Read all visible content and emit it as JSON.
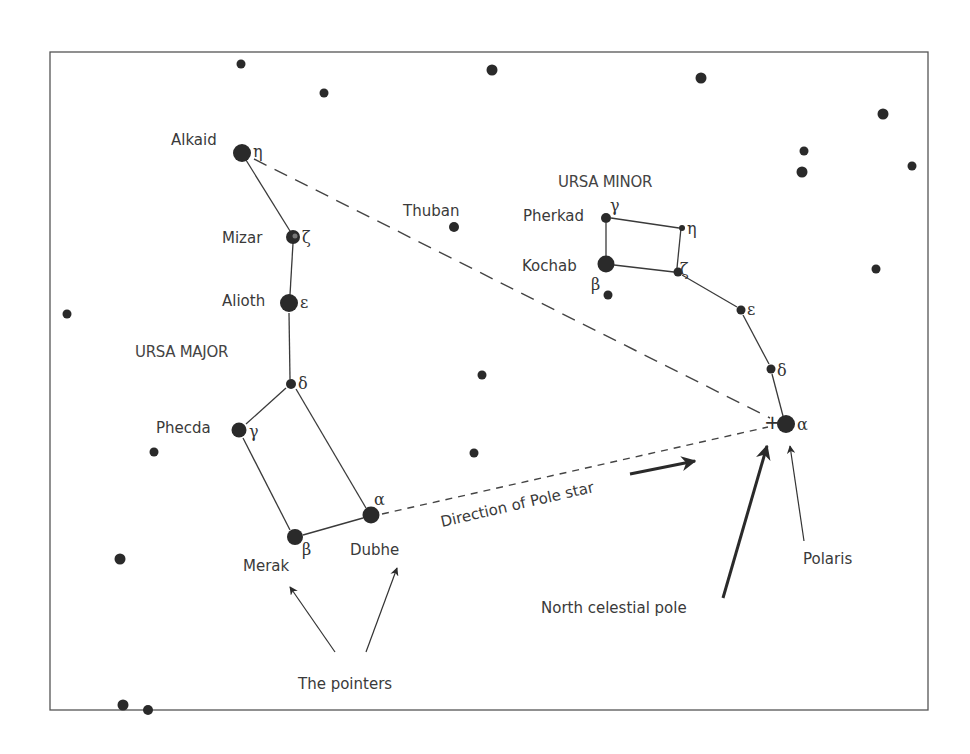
{
  "frame": {
    "x": 50,
    "y": 52,
    "width": 878,
    "height": 658,
    "stroke": "#555555"
  },
  "constellations": [
    {
      "name": "URSA MAJOR",
      "label_x": 135,
      "label_y": 357
    },
    {
      "name": "URSA MINOR",
      "label_x": 558,
      "label_y": 187
    }
  ],
  "named_stars": [
    {
      "id": "alkaid",
      "name": "Alkaid",
      "greek": "η",
      "x": 242,
      "y": 153,
      "r": 9
    },
    {
      "id": "mizar",
      "name": "Mizar",
      "greek": "ζ",
      "x": 293,
      "y": 237,
      "r": 7
    },
    {
      "id": "alioth",
      "name": "Alioth",
      "greek": "ε",
      "x": 289,
      "y": 303,
      "r": 9
    },
    {
      "id": "megrez",
      "name": "",
      "greek": "δ",
      "x": 291,
      "y": 384,
      "r": 5
    },
    {
      "id": "phecda",
      "name": "Phecda",
      "greek": "γ",
      "x": 239,
      "y": 430,
      "r": 7.5
    },
    {
      "id": "merak",
      "name": "Merak",
      "greek": "β",
      "x": 295,
      "y": 537,
      "r": 8
    },
    {
      "id": "dubhe",
      "name": "Dubhe",
      "greek": "α",
      "x": 371,
      "y": 515,
      "r": 8.5
    },
    {
      "id": "thuban",
      "name": "Thuban",
      "greek": "",
      "x": 454,
      "y": 227,
      "r": 5
    },
    {
      "id": "pherkad",
      "name": "Pherkad",
      "greek": "γ",
      "x": 606,
      "y": 218,
      "r": 5
    },
    {
      "id": "umi_eta",
      "name": "",
      "greek": "η",
      "x": 682,
      "y": 228,
      "r": 3
    },
    {
      "id": "kochab",
      "name": "Kochab",
      "greek": "β",
      "x": 606,
      "y": 264,
      "r": 8.5
    },
    {
      "id": "umi_zeta",
      "name": "",
      "greek": "ζ",
      "x": 678,
      "y": 272,
      "r": 4.5
    },
    {
      "id": "umi_epsilon",
      "name": "",
      "greek": "ε",
      "x": 741,
      "y": 310,
      "r": 4.5
    },
    {
      "id": "umi_delta",
      "name": "",
      "greek": "δ",
      "x": 771,
      "y": 369,
      "r": 4.5
    },
    {
      "id": "polaris",
      "name": "Polaris",
      "greek": "α",
      "x": 786,
      "y": 424,
      "r": 9
    }
  ],
  "background_stars": [
    {
      "x": 241,
      "y": 64,
      "r": 4.5
    },
    {
      "x": 324,
      "y": 93,
      "r": 4.5
    },
    {
      "x": 492,
      "y": 70,
      "r": 5.5
    },
    {
      "x": 701,
      "y": 78,
      "r": 5.5
    },
    {
      "x": 883,
      "y": 114,
      "r": 5.5
    },
    {
      "x": 804,
      "y": 151,
      "r": 4.5
    },
    {
      "x": 802,
      "y": 172,
      "r": 5.5
    },
    {
      "x": 912,
      "y": 166,
      "r": 4.5
    },
    {
      "x": 876,
      "y": 269,
      "r": 4.5
    },
    {
      "x": 67,
      "y": 314,
      "r": 4.5
    },
    {
      "x": 482,
      "y": 375,
      "r": 4.5
    },
    {
      "x": 154,
      "y": 452,
      "r": 4.5
    },
    {
      "x": 474,
      "y": 453,
      "r": 4.5
    },
    {
      "x": 120,
      "y": 559,
      "r": 5.5
    },
    {
      "x": 608,
      "y": 295,
      "r": 4.5
    },
    {
      "x": 123,
      "y": 705,
      "r": 5.5
    },
    {
      "x": 148,
      "y": 709,
      "r": 5
    }
  ],
  "labels": {
    "alkaid": "Alkaid",
    "mizar": "Mizar",
    "alioth": "Alioth",
    "ursa_major": "URSA MAJOR",
    "phecda": "Phecda",
    "merak": "Merak",
    "dubhe": "Dubhe",
    "thuban": "Thuban",
    "ursa_minor": "URSA MINOR",
    "pherkad": "Pherkad",
    "kochab": "Kochab",
    "direction": "Direction of Pole star",
    "ncp": "North celestial pole",
    "polaris": "Polaris",
    "pointers": "The pointers"
  },
  "greek": {
    "alkaid": "η",
    "mizar": "ζ",
    "alioth": "ε",
    "megrez": "δ",
    "phecda": "γ",
    "merak": "β",
    "dubhe": "α",
    "pherkad": "γ",
    "umi_eta": "η",
    "kochab": "β",
    "umi_zeta": "ζ",
    "umi_epsilon": "ε",
    "umi_delta": "δ",
    "polaris": "α"
  },
  "annotations": {
    "north_celestial_pole_marker": "+",
    "dashed_lines": [
      {
        "from": "Alkaid",
        "to": "North celestial pole"
      },
      {
        "from": "Dubhe",
        "to": "North celestial pole"
      }
    ],
    "arrows": [
      {
        "label": "The pointers",
        "targets": [
          "Merak",
          "Dubhe"
        ]
      },
      {
        "label": "North celestial pole",
        "target": "+"
      },
      {
        "label": "Polaris",
        "target": "Polaris"
      },
      {
        "label": "Direction of Pole star",
        "direction": "toward Polaris"
      }
    ]
  }
}
